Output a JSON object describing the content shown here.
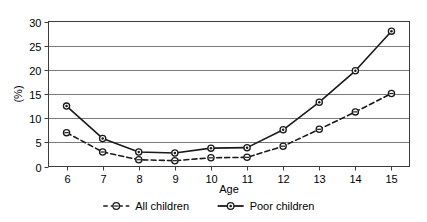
{
  "chart_data": {
    "type": "line",
    "title": "",
    "xlabel": "Age",
    "ylabel": "(%)",
    "x": [
      6,
      7,
      8,
      9,
      10,
      11,
      12,
      13,
      14,
      15
    ],
    "categories": [
      "6",
      "7",
      "8",
      "9",
      "10",
      "11",
      "12",
      "13",
      "14",
      "15"
    ],
    "xlim": [
      5.5,
      15.5
    ],
    "ylim": [
      0,
      30
    ],
    "yticks": [
      0,
      5,
      10,
      15,
      20,
      25,
      30
    ],
    "ytick_labels": [
      "0",
      "5",
      "10",
      "15",
      "20",
      "25",
      "30"
    ],
    "grid": "horizontal",
    "legend_position": "bottom",
    "series": [
      {
        "name": "All children",
        "values": [
          7.0,
          3.0,
          1.4,
          1.2,
          1.8,
          1.9,
          4.2,
          7.7,
          11.3,
          15.1
        ],
        "line_style": "dashed",
        "marker": "open-circle",
        "color": "#000000"
      },
      {
        "name": "Poor children",
        "values": [
          12.5,
          5.8,
          3.0,
          2.8,
          3.8,
          3.9,
          7.6,
          13.3,
          19.8,
          28.0
        ],
        "line_style": "solid",
        "marker": "filled-circle",
        "color": "#000000"
      }
    ]
  },
  "axes": {
    "y_label": "(%)",
    "x_label": "Age",
    "y_tick_labels": [
      "30",
      "25",
      "20",
      "15",
      "10",
      "5",
      "0"
    ],
    "x_tick_labels": [
      "6",
      "7",
      "8",
      "9",
      "10",
      "11",
      "12",
      "13",
      "14",
      "15"
    ]
  },
  "legend": {
    "entries": [
      {
        "label": "All children",
        "marker_icon": "open-circle-dashed-marker"
      },
      {
        "label": "Poor children",
        "marker_icon": "filled-circle-solid-marker"
      }
    ]
  },
  "colors": {
    "line": "#1a1a1a",
    "grid": "#7a7a7a",
    "frame": "#3c3c3c",
    "marker_fill": "#ffffff",
    "background": "#ffffff"
  }
}
